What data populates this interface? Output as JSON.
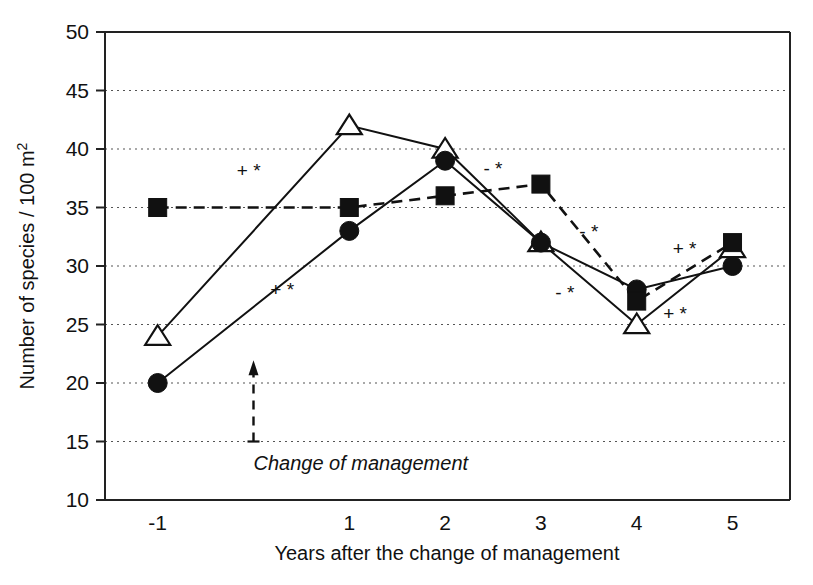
{
  "chart_data": {
    "type": "line",
    "title": "",
    "xlabel": "Years after the change of management",
    "ylabel": "Number of species / 100 m²",
    "ylabel_main": "Number of species / 100 m",
    "ylabel_sup": "2",
    "x": [
      -1,
      1,
      2,
      3,
      4,
      5
    ],
    "categories": [
      "-1",
      "1",
      "2",
      "3",
      "4",
      "5"
    ],
    "xlim": [
      -1.55,
      5.6
    ],
    "ylim": [
      10,
      50
    ],
    "yticks": [
      10,
      15,
      20,
      25,
      30,
      35,
      40,
      45,
      50
    ],
    "ytick_labels": [
      "10",
      "15",
      "20",
      "25",
      "30",
      "35",
      "40",
      "45",
      "50"
    ],
    "grid": "horizontal-dotted",
    "legend": "none",
    "series": [
      {
        "name": "open-triangle-series",
        "marker": "open-triangle",
        "line_style": "solid",
        "values": [
          24,
          42,
          40,
          32,
          25,
          31.5
        ]
      },
      {
        "name": "filled-circle-series",
        "marker": "filled-circle",
        "line_style": "solid",
        "values": [
          20,
          33,
          39,
          32,
          28,
          30
        ]
      },
      {
        "name": "filled-square-series",
        "marker": "filled-square",
        "line_style": "dashed",
        "values": [
          35,
          35,
          36,
          37,
          27,
          32
        ]
      }
    ],
    "annotations": [
      {
        "name": "change-of-management-label",
        "text": "Change of management",
        "x": 0,
        "y": 12.6,
        "style": "italic"
      },
      {
        "name": "sig-mark-1",
        "text": "+ *",
        "x": -0.05,
        "y": 37.6
      },
      {
        "name": "sig-mark-2",
        "text": "+ *",
        "x": 0.3,
        "y": 27.4
      },
      {
        "name": "sig-mark-3",
        "text": "- *",
        "x": 2.5,
        "y": 37.8
      },
      {
        "name": "sig-mark-4",
        "text": "- *",
        "x": 3.5,
        "y": 32.4
      },
      {
        "name": "sig-mark-5",
        "text": "- *",
        "x": 3.25,
        "y": 27.2
      },
      {
        "name": "sig-mark-6",
        "text": "+ *",
        "x": 4.5,
        "y": 30.9
      },
      {
        "name": "sig-mark-7",
        "text": "+ *",
        "x": 4.4,
        "y": 25.4
      }
    ],
    "arrow": {
      "name": "change-of-management-arrow",
      "x": 0,
      "y_from": 15,
      "y_to": 21.6,
      "style": "dashed-up-arrow"
    }
  },
  "colors": {
    "ink": "#111111",
    "grid": "#555555",
    "background": "#ffffff"
  }
}
